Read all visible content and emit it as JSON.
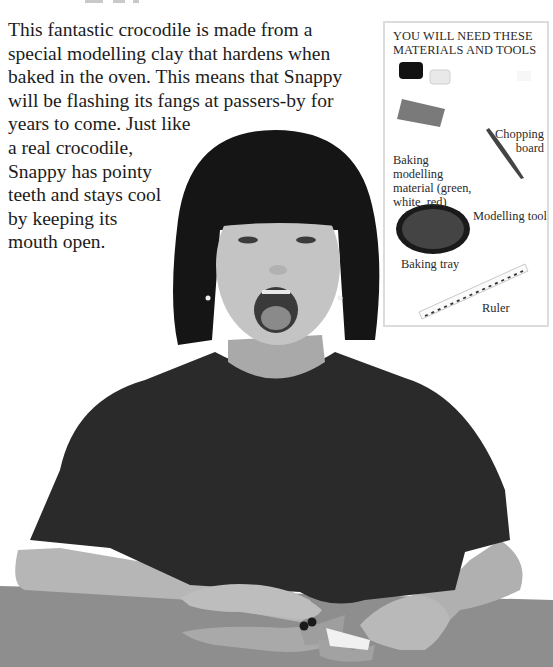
{
  "page": {
    "intro_lines": [
      "This fantastic crocodile is made from a",
      "special modelling clay that hardens when",
      "baked in the oven. This means that Snappy",
      "will be flashing its fangs at passers-by for",
      "years to come. Just like",
      "a real crocodile,",
      "Snappy has pointy",
      "teeth and stays cool",
      "by keeping its",
      "mouth open."
    ]
  },
  "materials_box": {
    "heading_lines": [
      "YOU WILL NEED THESE",
      "MATERIALS AND TOOLS"
    ],
    "items": [
      {
        "label_lines": [
          "Baking",
          "modelling",
          "material (green,",
          "white, red)"
        ],
        "icon": "clay-blocks-icon"
      },
      {
        "label_lines": [
          "Chopping",
          "board"
        ],
        "icon": "chopping-board-icon"
      },
      {
        "label_lines": [
          "Modelling tool"
        ],
        "icon": "modelling-tool-icon"
      },
      {
        "label_lines": [
          "Baking tray"
        ],
        "icon": "baking-tray-icon"
      },
      {
        "label_lines": [
          "Ruler"
        ],
        "icon": "ruler-icon"
      }
    ]
  },
  "photo": {
    "subject": "girl with open mouth at table with clay crocodile",
    "colors": {
      "hair": "#161616",
      "skin": "#bdbdbd",
      "shirt": "#2b2b2b",
      "table": "#8f8f8f",
      "croc": "#a5a5a5"
    }
  }
}
